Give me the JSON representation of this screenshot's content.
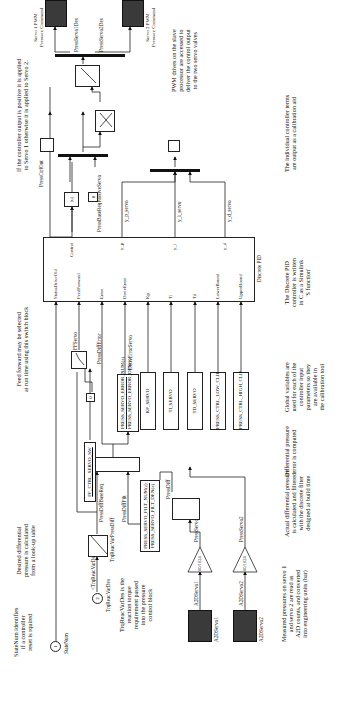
{
  "outputs": {
    "servo1": {
      "label": "Servo 1 PWM\nPressure Command",
      "signal": "PressServo1Des"
    },
    "servo2": {
      "label": "Servo 2 PWM\nPressure Command",
      "signal": "PressServo2Des"
    }
  },
  "inputs": {
    "in1": {
      "number": "1",
      "label": "StateNum"
    },
    "in2": {
      "number": "2",
      "label": "TrqReacVarDes",
      "tag": "<TrqReacVarDes>"
    },
    "a2d1": {
      "label": "A2DServo1",
      "signal": "A2DServo1"
    },
    "a2d2": {
      "label": "A2DServo2",
      "signal": "A2DServo2"
    }
  },
  "gains": {
    "g1": "60/1024",
    "g2": "60/1024"
  },
  "signals": {
    "press_servo1": "PressServo1",
    "press_servo2": "PressServo2",
    "press_diff": "PressDiff",
    "press_diff_filt": "PressDiffFilt",
    "press_diff_base_req": "PressDiffBaseReq",
    "trq_to_pressdiff": "TrqReacVarPressDiff",
    "press_diff_error": "PressDiffError",
    "deriv_error_servo": "DerivErrorServo",
    "ff_servo": "FFServo",
    "press_ctrl_out": "PressCtrlOut",
    "press_base_req_passive": "PressBaseReqPassiveServo",
    "y_p": "y_p_servo",
    "y_i": "y_i_servo",
    "y_d": "y_d_servo"
  },
  "blocks": {
    "lookup": "TrqReacVarPressDiff",
    "ff_switch_param": "FF_CTRL_SERVO_SW",
    "filt_num": "PRESS_SERVO_FILT_NUM(z)",
    "filt_den": "PRESS_SERVO_FILT_DEN(z)",
    "err_num": "PRESS_SERVO_ERROR_NUM(z)",
    "err_den": "PRESS_SERVO_ERROR_DEN(z)",
    "kp": "KP_SERVO",
    "ti": "TI_SERVO",
    "td": "TD_SERVO",
    "low_clip": "PRESS_CTRL_LOW_CLIP",
    "high_clip": "PRESS_CTRL_HIGH_CLIP",
    "const_zero_1": "0",
    "const_zero_2": "0",
    "abs": "|u|"
  },
  "pid": {
    "title": "Discrete PID",
    "inputs": [
      "StatusDriveOld",
      "FeedForward",
      "Error",
      "DerivError",
      "Kp",
      "Ti",
      "Td",
      "LowerBound",
      "UpperBound"
    ],
    "outputs": [
      "Control",
      "y_p",
      "y_i",
      "y_d"
    ]
  },
  "notes": {
    "statenum": "StateNum identifies\nif a controller\nreset is rquired",
    "trqreac": "TrqReacVarDes is the\nreaction torque\nrequirement passed\ninto the pressure\ncontrol block",
    "measured": "Measured pressures on servo 1\nand servo 2 are read as\nA2D counts, and converted\ninto engineering units (bar)",
    "desired": "Desired differential\npressure is calculated\nfrom a look-up table",
    "actual": "Actual differential pressure\nis calculated and filtered\nwith the discrete filter\ndesigned at build time",
    "differr": "Differential pressure\nerror is computed",
    "feedforward": "Feed forward may be selected\nat run time using this switch block",
    "globals": "Global variables are\nused for each of the\ncontroller input\nparameters so they\nare available in\nthe calibration tool",
    "routing": "If the controller output is positive it is applied\nto Servo 1 otherwise it is applied to Servo 2.",
    "pidnote": "The Discrete PID\ncontroller is written\nin C as a Simulink\n'S function'",
    "terms": "The individual controller terms\nare output as a calibration aid",
    "pwm": "PWM drives on the slave\nprocessor are accessed to\ndeliver the control output\nto the two servo valves"
  }
}
